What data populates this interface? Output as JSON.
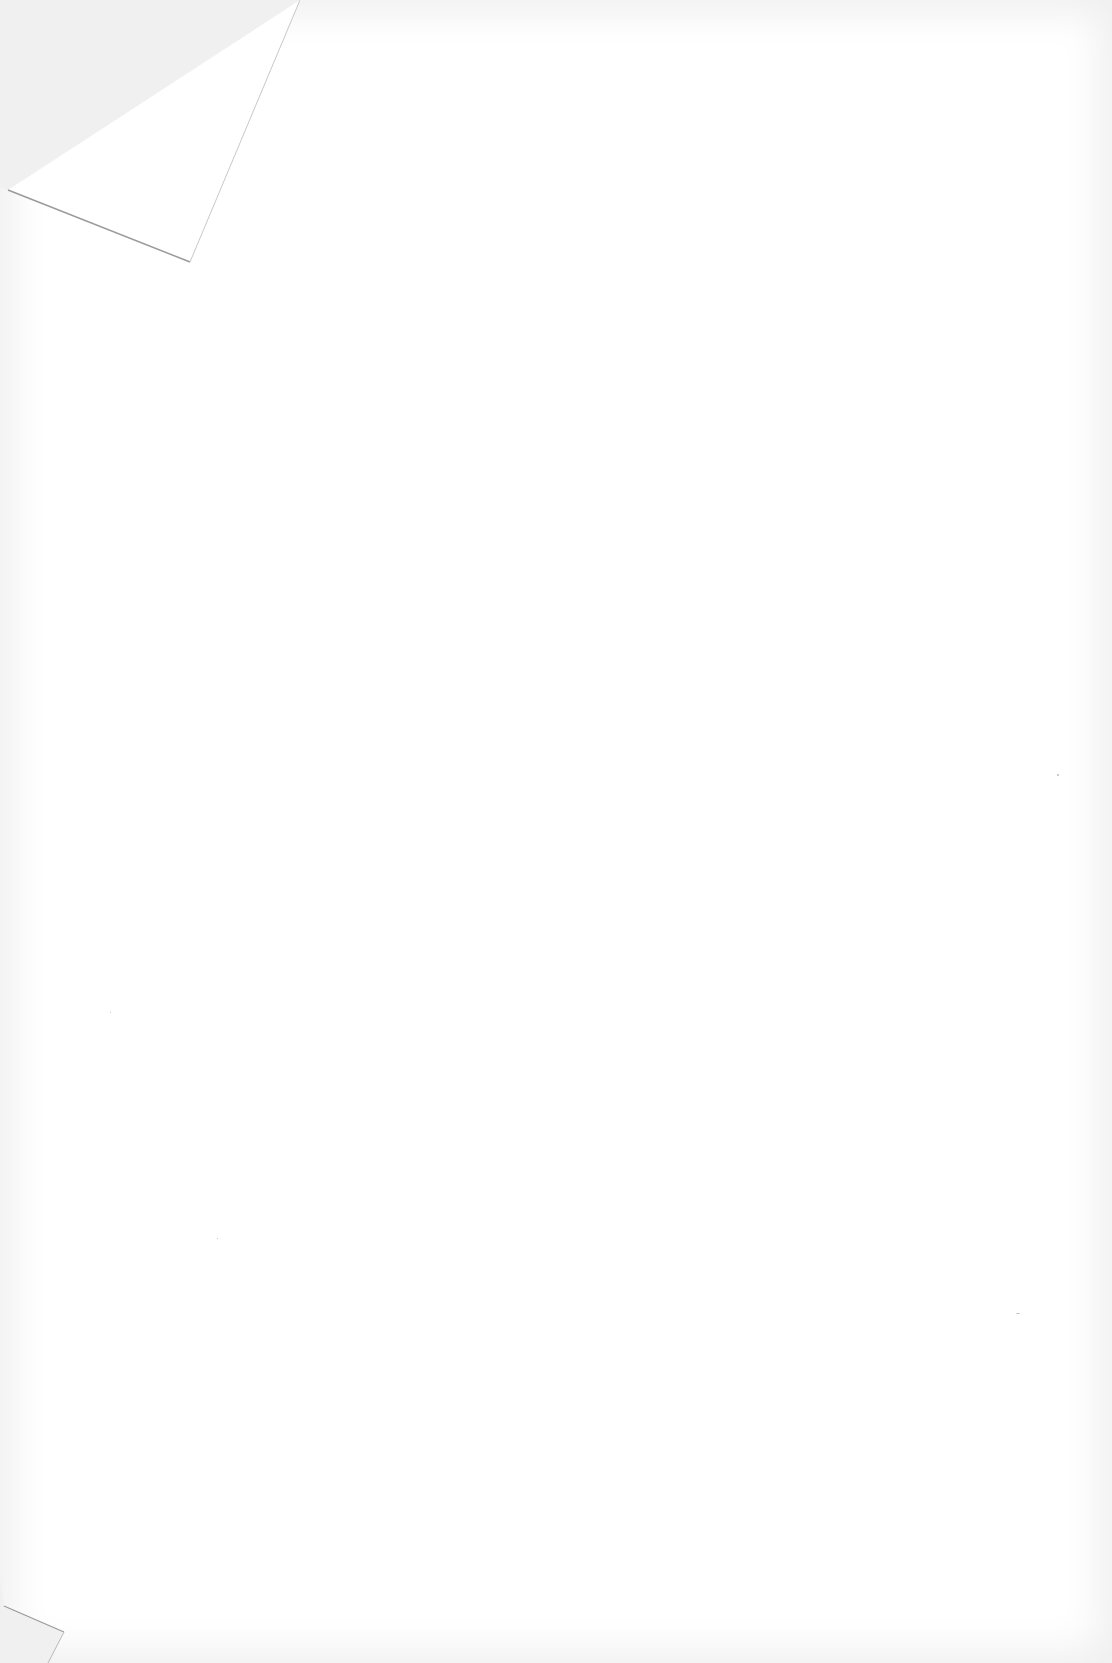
{
  "document": {
    "type": "blank scanned page",
    "text": "",
    "colors": {
      "paper": "#ffffff",
      "background": "#f2f2f2",
      "fold_edge": "#9a9a9a"
    },
    "features": [
      "folded-top-left-corner",
      "folded-bottom-left-corner"
    ]
  }
}
